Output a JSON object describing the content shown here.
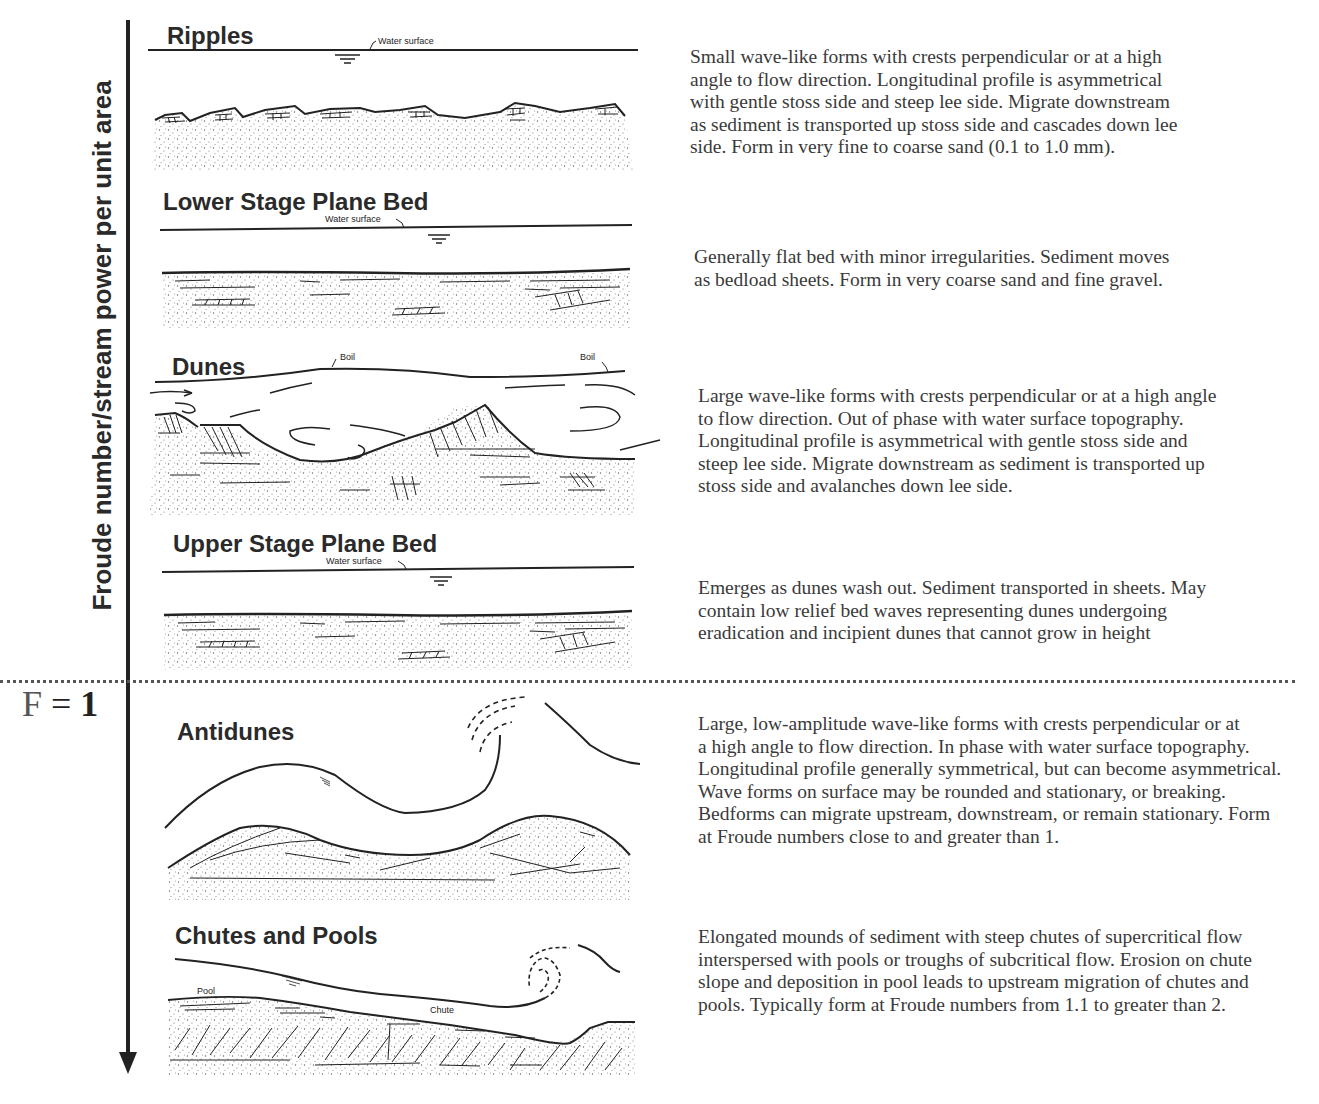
{
  "figure": {
    "axis_label": "Froude number/stream power per unit area",
    "axis_direction": "down (increasing)",
    "threshold": {
      "label_symbol": "F",
      "label_equals": "=",
      "label_value": "1"
    }
  },
  "bedforms": [
    {
      "name": "Ripples",
      "annotations": [
        "Water surface"
      ],
      "description_lines": [
        "Small wave-like forms with crests perpendicular or at a high",
        "angle to flow direction. Longitudinal profile is asymmetrical",
        "with gentle stoss side and steep lee side.  Migrate downstream",
        "as sediment is transported up stoss side and cascades down lee",
        "side.  Form in very fine to coarse sand (0.1 to 1.0 mm)."
      ]
    },
    {
      "name": "Lower Stage Plane Bed",
      "annotations": [
        "Water surface"
      ],
      "description_lines": [
        "Generally flat bed with minor irregularities. Sediment moves",
        "as bedload sheets.  Form in very coarse sand and fine gravel."
      ]
    },
    {
      "name": "Dunes",
      "annotations": [
        "Boil",
        "Boil"
      ],
      "description_lines": [
        "Large wave-like forms with crests perpendicular or at a high angle",
        "to flow direction. Out of phase with water surface topography.",
        "Longitudinal profile is asymmetrical with gentle stoss side and",
        "steep lee side.  Migrate downstream as sediment is transported up",
        "stoss side and avalanches down lee side."
      ]
    },
    {
      "name": "Upper Stage Plane Bed",
      "annotations": [
        "Water surface"
      ],
      "description_lines": [
        "Emerges as dunes wash out.  Sediment transported in sheets.  May",
        "contain low relief bed waves representing dunes undergoing",
        "eradication and incipient dunes that cannot grow in height"
      ]
    },
    {
      "name": "Antidunes",
      "annotations": [],
      "description_lines": [
        "Large, low-amplitude wave-like forms with crests perpendicular or at",
        "a high angle to flow direction.  In phase with water surface topography.",
        "Longitudinal profile generally symmetrical, but can become asymmetrical.",
        "Wave forms on surface may be rounded and stationary, or breaking.",
        "Bedforms can migrate upstream, downstream, or remain stationary.  Form",
        "at Froude numbers close to and greater than 1."
      ]
    },
    {
      "name": "Chutes and Pools",
      "annotations": [
        "Pool",
        "Chute"
      ],
      "description_lines": [
        "Elongated mounds of sediment with steep chutes of supercritical flow",
        "interspersed with pools or troughs of subcritical flow.  Erosion on chute",
        "slope and deposition in pool leads to upstream migration of chutes and",
        "pools. Typically form at Froude numbers from 1.1 to greater than 2."
      ]
    }
  ],
  "colors": {
    "ink": "#222222",
    "text": "#3a3a3a",
    "background": "#ffffff"
  }
}
